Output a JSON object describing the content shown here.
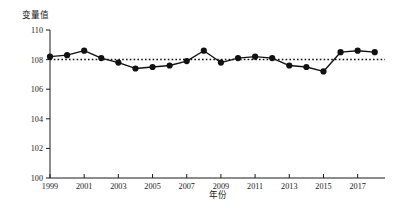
{
  "chart_data": {
    "type": "line",
    "title": "",
    "xlabel": "年份",
    "ylabel": "变量值",
    "grid": false,
    "legend": "none",
    "xlim": [
      1999,
      2018.6
    ],
    "ylim": [
      100,
      110
    ],
    "yticks": [
      100,
      102,
      104,
      106,
      108,
      110
    ],
    "ytick_labels": [
      "100",
      "102",
      "104",
      "106",
      "108",
      "110"
    ],
    "xticks": [
      1999,
      2001,
      2003,
      2005,
      2007,
      2009,
      2011,
      2013,
      2015,
      2017
    ],
    "xtick_labels": [
      "1999",
      "2001",
      "2003",
      "2005",
      "2007",
      "2009",
      "2011",
      "2013",
      "2015",
      "2017"
    ],
    "reference_line": {
      "orientation": "horizontal",
      "value": 108,
      "style": "dotted"
    },
    "x": [
      1999,
      2000,
      2001,
      2002,
      2003,
      2004,
      2005,
      2006,
      2007,
      2008,
      2009,
      2010,
      2011,
      2012,
      2013,
      2014,
      2015,
      2016,
      2017,
      2018
    ],
    "values": [
      108.2,
      108.3,
      108.6,
      108.1,
      107.8,
      107.4,
      107.5,
      107.6,
      107.9,
      108.6,
      107.8,
      108.1,
      108.2,
      108.1,
      107.6,
      107.5,
      107.2,
      108.5,
      108.6,
      108.5
    ],
    "series": [
      {
        "name": "变量值",
        "marker": "filled-circle",
        "color": "#111111",
        "values": [
          108.2,
          108.3,
          108.6,
          108.1,
          107.8,
          107.4,
          107.5,
          107.6,
          107.9,
          108.6,
          107.8,
          108.1,
          108.2,
          108.1,
          107.6,
          107.5,
          107.2,
          108.5,
          108.6,
          108.5
        ]
      }
    ]
  }
}
